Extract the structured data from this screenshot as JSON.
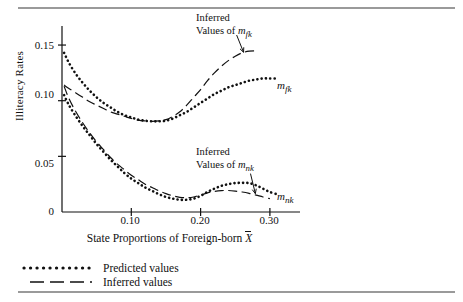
{
  "figure": {
    "y_axis_title": "Illiteracy Rates",
    "x_axis_title_prefix": "State Proportions of Foreign-born ",
    "x_axis_title_variable": "X",
    "y_ticks": [
      "0.15",
      "0.10",
      "0.05",
      "0"
    ],
    "x_ticks": [
      "0.10",
      "0.20",
      "0.30"
    ]
  },
  "annotations": {
    "upper": {
      "line1": "Inferred",
      "line2_prefix": "Values of ",
      "line2_var": "m",
      "line2_sub": "fk"
    },
    "lower": {
      "line1": "Inferred",
      "line2_prefix": "Values of ",
      "line2_var": "m",
      "line2_sub": "nk"
    }
  },
  "series_labels": {
    "upper_right": {
      "var": "m",
      "sub": "fk"
    },
    "lower_right": {
      "var": "m",
      "sub": "nk"
    }
  },
  "legend": {
    "items": [
      {
        "key": "dotted-line-key",
        "label": "Predicted values"
      },
      {
        "key": "dashed-line-key",
        "label": "Inferred values"
      }
    ]
  },
  "chart_data": {
    "type": "line",
    "title": "",
    "xlabel": "State Proportions of Foreign-born X̄",
    "ylabel": "Illiteracy Rates",
    "xlim": [
      0.0,
      0.33
    ],
    "ylim": [
      0.0,
      0.165
    ],
    "xticks": [
      0.1,
      0.2,
      0.3
    ],
    "yticks": [
      0,
      0.05,
      0.1,
      0.15
    ],
    "grid": false,
    "legend_position": "below-axes-left",
    "series": [
      {
        "name": "Predicted values of m_fk",
        "style": "dotted",
        "x": [
          0.003,
          0.01,
          0.02,
          0.03,
          0.04,
          0.05,
          0.06,
          0.07,
          0.08,
          0.09,
          0.1,
          0.11,
          0.12,
          0.13,
          0.14,
          0.15,
          0.16,
          0.17,
          0.18,
          0.19,
          0.2,
          0.21,
          0.22,
          0.23,
          0.24,
          0.25,
          0.26,
          0.27,
          0.28,
          0.29,
          0.3,
          0.31
        ],
        "y": [
          0.143,
          0.134,
          0.124,
          0.116,
          0.109,
          0.103,
          0.098,
          0.094,
          0.09,
          0.087,
          0.085,
          0.083,
          0.082,
          0.0815,
          0.0815,
          0.082,
          0.084,
          0.087,
          0.09,
          0.094,
          0.098,
          0.102,
          0.106,
          0.109,
          0.112,
          0.114,
          0.116,
          0.118,
          0.119,
          0.12,
          0.12,
          0.12
        ]
      },
      {
        "name": "Inferred values of m_fk",
        "style": "dashed",
        "x": [
          0.003,
          0.01,
          0.02,
          0.03,
          0.04,
          0.05,
          0.06,
          0.07,
          0.08,
          0.09,
          0.1,
          0.11,
          0.12,
          0.13,
          0.14,
          0.15,
          0.16,
          0.17,
          0.18,
          0.19,
          0.2,
          0.21,
          0.22,
          0.23,
          0.24,
          0.25,
          0.26,
          0.27,
          0.28
        ],
        "y": [
          0.114,
          0.111,
          0.107,
          0.103,
          0.099,
          0.096,
          0.093,
          0.09,
          0.088,
          0.086,
          0.084,
          0.0825,
          0.0818,
          0.0815,
          0.0818,
          0.083,
          0.086,
          0.09,
          0.096,
          0.103,
          0.11,
          0.118,
          0.125,
          0.131,
          0.136,
          0.14,
          0.143,
          0.1445,
          0.1448
        ]
      },
      {
        "name": "Predicted values of m_nk",
        "style": "dotted",
        "x": [
          0.003,
          0.01,
          0.02,
          0.03,
          0.04,
          0.05,
          0.06,
          0.07,
          0.08,
          0.09,
          0.1,
          0.11,
          0.12,
          0.13,
          0.14,
          0.15,
          0.16,
          0.17,
          0.18,
          0.19,
          0.2,
          0.21,
          0.22,
          0.23,
          0.24,
          0.25,
          0.26,
          0.27,
          0.28,
          0.29,
          0.3,
          0.31
        ],
        "y": [
          0.105,
          0.096,
          0.086,
          0.077,
          0.069,
          0.061,
          0.054,
          0.047,
          0.041,
          0.035,
          0.03,
          0.026,
          0.022,
          0.019,
          0.016,
          0.0135,
          0.012,
          0.011,
          0.011,
          0.012,
          0.0145,
          0.018,
          0.021,
          0.0235,
          0.025,
          0.026,
          0.0262,
          0.026,
          0.024,
          0.021,
          0.018,
          0.016
        ]
      },
      {
        "name": "Inferred values of m_nk",
        "style": "dashed",
        "x": [
          0.003,
          0.01,
          0.02,
          0.03,
          0.04,
          0.05,
          0.06,
          0.07,
          0.08,
          0.09,
          0.1,
          0.11,
          0.12,
          0.13,
          0.14,
          0.15,
          0.16,
          0.17,
          0.18,
          0.19,
          0.2,
          0.21,
          0.22,
          0.23,
          0.24,
          0.25,
          0.26,
          0.27,
          0.28,
          0.29,
          0.3
        ],
        "y": [
          0.113,
          0.102,
          0.09,
          0.08,
          0.071,
          0.063,
          0.056,
          0.049,
          0.043,
          0.038,
          0.033,
          0.029,
          0.025,
          0.022,
          0.019,
          0.0165,
          0.0145,
          0.0132,
          0.0128,
          0.0135,
          0.0152,
          0.0172,
          0.0185,
          0.0192,
          0.0193,
          0.0188,
          0.018,
          0.0168,
          0.0152,
          0.0135,
          0.012
        ]
      }
    ],
    "pointers": [
      {
        "label": "Inferred Values of m_fk",
        "from": [
          0.252,
          0.159
        ],
        "to": [
          0.262,
          0.1435
        ]
      },
      {
        "label": "Inferred Values of m_nk",
        "from": [
          0.272,
          0.0345
        ],
        "to": [
          0.279,
          0.0165
        ]
      }
    ]
  }
}
